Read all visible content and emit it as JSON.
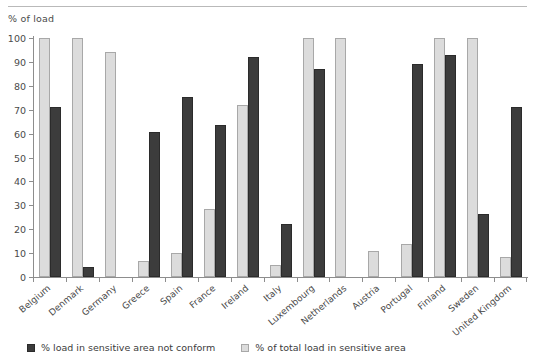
{
  "chart_data": {
    "type": "bar",
    "title": "",
    "xlabel": "",
    "ylabel": "% of load",
    "ylim": [
      0,
      100
    ],
    "ytick_step": 10,
    "yticks": [
      100,
      90,
      80,
      70,
      60,
      50,
      40,
      30,
      20,
      10,
      0
    ],
    "grid": false,
    "legend_position": "bottom-left",
    "categories": [
      "Belgium",
      "Denmark",
      "Germany",
      "Greece",
      "Spain",
      "France",
      "Ireland",
      "Italy",
      "Luxembourg",
      "Netherlands",
      "Austria",
      "Portugal",
      "Finland",
      "Sweden",
      "United Kingdom"
    ],
    "series": [
      {
        "name": "% of total load in sensitive area",
        "key": "light",
        "color": "#dcdcdc",
        "border_color": "#a8a8a8",
        "values": [
          100,
          100,
          94,
          6.5,
          10,
          28.5,
          72,
          5,
          100,
          100,
          11,
          14,
          100,
          100,
          8.5
        ]
      },
      {
        "name": "% load in sensitive area not conform",
        "key": "dark",
        "color": "#3c3c3c",
        "border_color": "#2b2b2b",
        "values": [
          71,
          4,
          0,
          60.5,
          75.5,
          63.5,
          92,
          22,
          87,
          0,
          0,
          89,
          93,
          26.5,
          71
        ]
      }
    ]
  },
  "legend": {
    "items": [
      {
        "label": "% load in sensitive area not conform",
        "swatch": "dark"
      },
      {
        "label": "% of total load in sensitive area",
        "swatch": "light"
      }
    ]
  }
}
